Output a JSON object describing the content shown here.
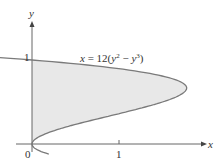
{
  "chart_data": {
    "type": "area",
    "title": "",
    "equation_label": "x = 12(y² − y³)",
    "xlabel": "x",
    "ylabel": "y",
    "x_ticks": [
      "0",
      "1"
    ],
    "y_ticks": [
      "1"
    ],
    "origin_label": "0",
    "curve": {
      "function": "x = 12(y^2 - y^3)",
      "y_range": [
        0,
        1
      ],
      "max_x": 1.78,
      "max_at_y": 0.667,
      "points": [
        {
          "y": 0.0,
          "x": 0.0
        },
        {
          "y": 0.1,
          "x": 0.108
        },
        {
          "y": 0.2,
          "x": 0.384
        },
        {
          "y": 0.3,
          "x": 0.756
        },
        {
          "y": 0.4,
          "x": 1.152
        },
        {
          "y": 0.5,
          "x": 1.5
        },
        {
          "y": 0.6,
          "x": 1.728
        },
        {
          "y": 0.667,
          "x": 1.778
        },
        {
          "y": 0.7,
          "x": 1.764
        },
        {
          "y": 0.8,
          "x": 1.536
        },
        {
          "y": 0.9,
          "x": 0.972
        },
        {
          "y": 1.0,
          "x": 0.0
        }
      ]
    },
    "shaded_region": "between y-axis and curve, 0 ≤ y ≤ 1",
    "xlim": [
      -0.35,
      2.0
    ],
    "ylim": [
      -0.2,
      1.4
    ],
    "grid": false,
    "colors": {
      "fill": "#e6e6e6",
      "curve": "#777777",
      "axis": "#555555"
    }
  }
}
